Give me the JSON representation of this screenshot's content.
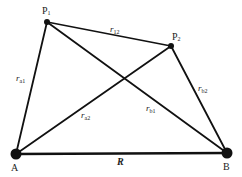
{
  "diagram": {
    "type": "geometry",
    "nodes": [
      {
        "id": "P1",
        "label": "P",
        "sub": "1",
        "x": 47,
        "y": 22,
        "r": 3
      },
      {
        "id": "P2",
        "label": "P",
        "sub": "2",
        "x": 171,
        "y": 46,
        "r": 3
      },
      {
        "id": "A",
        "label": "A",
        "x": 16,
        "y": 154,
        "r": 5
      },
      {
        "id": "B",
        "label": "B",
        "x": 227,
        "y": 153,
        "r": 5
      }
    ],
    "edges": [
      {
        "from": "P1",
        "to": "P2",
        "label": "r",
        "sub": "12",
        "width": 1.4
      },
      {
        "from": "P1",
        "to": "A",
        "label": "r",
        "sub": "a1",
        "width": 1.8
      },
      {
        "from": "P1",
        "to": "B",
        "label": "r",
        "sub": "b1",
        "width": 1.8
      },
      {
        "from": "P2",
        "to": "A",
        "label": "r",
        "sub": "a2",
        "width": 1.8
      },
      {
        "from": "P2",
        "to": "B",
        "label": "r",
        "sub": "b2",
        "width": 1.8
      },
      {
        "from": "A",
        "to": "B",
        "label": "R",
        "width": 2.6
      }
    ],
    "labels": {
      "P1": {
        "main": "P",
        "sub": "1"
      },
      "P2": {
        "main": "P",
        "sub": "2"
      },
      "A": "A",
      "B": "B",
      "r12": {
        "main": "r",
        "sub": "12"
      },
      "ra1": {
        "main": "r",
        "sub": "a1"
      },
      "ra2": {
        "main": "r",
        "sub": "a2"
      },
      "rb1": {
        "main": "r",
        "sub": "b1"
      },
      "rb2": {
        "main": "r",
        "sub": "b2"
      },
      "R": "R"
    },
    "colors": {
      "line": "#111111",
      "text": "#222222",
      "background": "#ffffff"
    }
  }
}
